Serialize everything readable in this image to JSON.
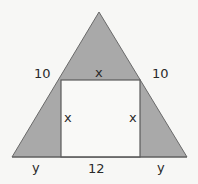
{
  "diagram": {
    "type": "geometry",
    "colors": {
      "background": "#f7f7f5",
      "shaded": "#a9a9a9",
      "square_fill": "#f9f9f7",
      "stroke": "#5a5a5a",
      "text": "#2a2a2a"
    },
    "labels": {
      "left_upper_side": "10",
      "square_top": "x",
      "right_upper_side": "10",
      "square_left": "x",
      "square_right": "x",
      "base_left": "y",
      "square_bottom": "12",
      "base_right": "y"
    },
    "geometry": {
      "apex": [
        99,
        12
      ],
      "base_left": [
        12,
        157
      ],
      "base_right": [
        187,
        157
      ],
      "square": {
        "x": 61,
        "y": 80,
        "width": 79,
        "height": 77
      }
    }
  }
}
